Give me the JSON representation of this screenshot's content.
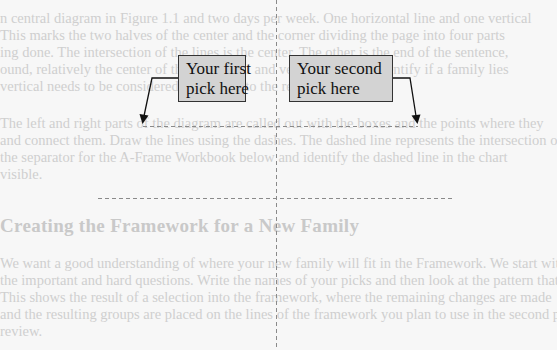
{
  "document": {
    "background_paragraph_1": [
      "n central diagram in Figure 1.1 and two days per week. One horizontal line and one vertical",
      "This marks the two halves of the center and the corner dividing the page into four parts",
      "ing done. The intersection of the lines is the center. The other is the end of the sentence,",
      "ound, relatively the center of the horizontal and vertical lines, to identify if a family lies",
      "vertical needs to be considered in relation to the rest of the picture."
    ],
    "background_paragraph_2": [
      "The left and right parts of the diagram are called out with the boxes and the points where they",
      "and connect them. Draw the lines using the dashes. The dashed line represents the intersection of lines",
      "the separator for the A-Frame Workbook below and identify the dashed line in the chart",
      "visible."
    ],
    "heading": "Creating the Framework for a New Family",
    "background_paragraph_3": [
      "We want a good understanding of where your new family will fit in the Framework. We start with",
      "the important and hard questions. Write the names of your picks and then look at the pattern that",
      "This shows the result of a selection into the framework, where the remaining changes are made",
      "and the resulting groups are placed on the lines of the framework you plan to use in the second part",
      "review."
    ]
  },
  "diagram": {
    "callouts": [
      {
        "id": "first",
        "lines": [
          "Your first",
          "pick here"
        ]
      },
      {
        "id": "second",
        "lines": [
          "Your second",
          "pick here"
        ]
      }
    ],
    "colors": {
      "callout_fill": "#d3d3d3",
      "callout_border": "#333333",
      "arrow": "#111111",
      "dashed_line": "#888888"
    }
  }
}
